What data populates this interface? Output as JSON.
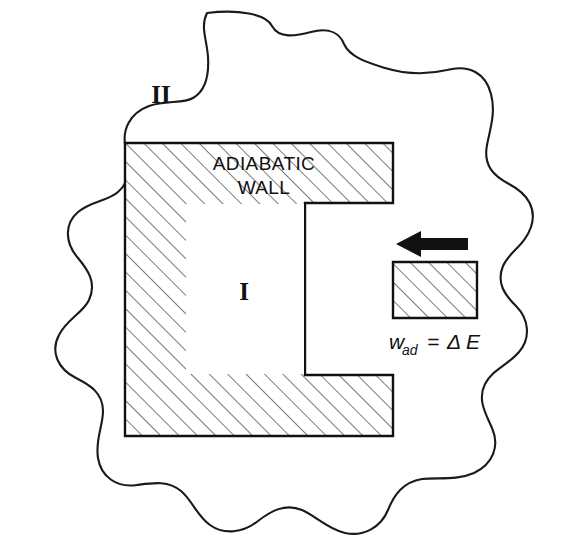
{
  "figure": {
    "background_color": "#ffffff",
    "ink_color": "#111111",
    "hatch_color": "#3a3a3a"
  },
  "labels": {
    "surroundings": "II",
    "system": "I",
    "wall_line1": "ADIABATIC",
    "wall_line2": "WALL",
    "work_variable": "w",
    "work_subscript": "ad",
    "work_equals": "=",
    "work_delta": "Δ",
    "work_energy": "E",
    "work_full": "w_ad = ΔE"
  },
  "geometry": {
    "canvas": {
      "width": 563,
      "height": 545
    },
    "wall_outline_points": "125,143 393,143 393,203 305,203 305,375 393,375 393,436 125,436",
    "piston_rod_points": "393,262 477,262 477,318 393,318",
    "chamber_rect": {
      "x": 185,
      "y": 203,
      "width": 120,
      "height": 172
    },
    "arrow": {
      "tip_x": 396,
      "tail_x": 468,
      "y": 244
    },
    "hatch_spacing": 13,
    "hatch_angle_deg": 45
  },
  "text_positions": {
    "surroundings": {
      "x": 161,
      "y": 103
    },
    "system": {
      "x": 244,
      "y": 300
    },
    "wall_line1": {
      "x": 264,
      "y": 170
    },
    "wall_line2": {
      "x": 264,
      "y": 194
    },
    "work": {
      "x": 389,
      "y": 349
    }
  }
}
